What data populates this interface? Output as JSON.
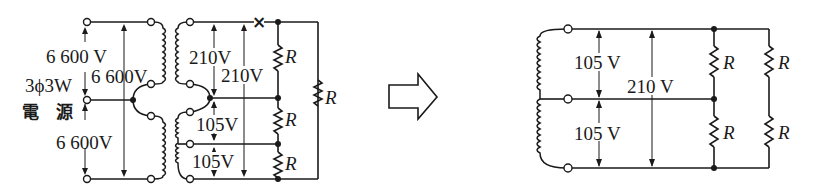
{
  "figure": {
    "before": {
      "source_label_line1": "3ϕ3W",
      "source_label_line2": "電　源",
      "primary_voltages": {
        "top": "6 600 V",
        "across": "6 600V",
        "bottom": "6 600V"
      },
      "secondary_voltages": {
        "upper_left": "210V",
        "upper_right": "210V",
        "lower_top": "105V",
        "lower_bottom": "105V"
      },
      "resistors": [
        "R",
        "R",
        "R",
        "R"
      ],
      "break_mark": "×"
    },
    "transition_arrow": "right-arrow",
    "after": {
      "voltages": {
        "upper": "105 V",
        "lower": "105 V",
        "total": "210 V"
      },
      "resistors": [
        "R",
        "R",
        "R",
        "R"
      ]
    }
  }
}
